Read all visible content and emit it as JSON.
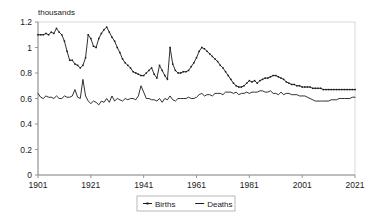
{
  "chart_data": {
    "type": "line",
    "title": "",
    "subtitle": "",
    "unit_label": "thousands",
    "xlabel": "",
    "ylabel": "",
    "xlim": [
      1901,
      2021
    ],
    "ylim": [
      0,
      1.2
    ],
    "ytick_values": [
      0,
      0.2,
      0.4,
      0.6,
      0.8,
      1,
      1.2
    ],
    "ytick_labels": [
      "0",
      "0.2",
      "0.4",
      "0.6",
      "0.8",
      "1",
      "1.2"
    ],
    "xtick_values": [
      1901,
      1921,
      1941,
      1961,
      1981,
      2001,
      2021
    ],
    "xtick_labels": [
      "1901",
      "1921",
      "1941",
      "1961",
      "1981",
      "2001",
      "2021"
    ],
    "grid": false,
    "legend_position": "bottom-center",
    "x": [
      1901,
      1902,
      1903,
      1904,
      1905,
      1906,
      1907,
      1908,
      1909,
      1910,
      1911,
      1912,
      1913,
      1914,
      1915,
      1916,
      1917,
      1918,
      1919,
      1920,
      1921,
      1922,
      1923,
      1924,
      1925,
      1926,
      1927,
      1928,
      1929,
      1930,
      1931,
      1932,
      1933,
      1934,
      1935,
      1936,
      1937,
      1938,
      1939,
      1940,
      1941,
      1942,
      1943,
      1944,
      1945,
      1946,
      1947,
      1948,
      1949,
      1950,
      1951,
      1952,
      1953,
      1954,
      1955,
      1956,
      1957,
      1958,
      1959,
      1960,
      1961,
      1962,
      1963,
      1964,
      1965,
      1966,
      1967,
      1968,
      1969,
      1970,
      1971,
      1972,
      1973,
      1974,
      1975,
      1976,
      1977,
      1978,
      1979,
      1980,
      1981,
      1982,
      1983,
      1984,
      1985,
      1986,
      1987,
      1988,
      1989,
      1990,
      1991,
      1992,
      1993,
      1994,
      1995,
      1996,
      1997,
      1998,
      1999,
      2000,
      2001,
      2002,
      2003,
      2004,
      2005,
      2006,
      2007,
      2008,
      2009,
      2010,
      2011,
      2012,
      2013,
      2014,
      2015,
      2016,
      2017,
      2018,
      2019,
      2020,
      2021
    ],
    "series": [
      {
        "name": "Births",
        "marker": "small-dot",
        "color": "#1a1a1a",
        "values": [
          1.1,
          1.1,
          1.1,
          1.11,
          1.1,
          1.12,
          1.11,
          1.15,
          1.12,
          1.1,
          1.05,
          0.97,
          0.9,
          0.9,
          0.87,
          0.86,
          0.84,
          0.86,
          0.92,
          1.1,
          1.07,
          1.01,
          1.0,
          1.07,
          1.11,
          1.14,
          1.16,
          1.12,
          1.08,
          1.05,
          1.0,
          0.96,
          0.91,
          0.88,
          0.86,
          0.84,
          0.81,
          0.8,
          0.79,
          0.78,
          0.78,
          0.8,
          0.82,
          0.84,
          0.79,
          0.76,
          0.86,
          0.82,
          0.78,
          0.75,
          1.0,
          0.87,
          0.82,
          0.8,
          0.8,
          0.81,
          0.81,
          0.82,
          0.85,
          0.88,
          0.92,
          0.97,
          1.0,
          0.99,
          0.97,
          0.95,
          0.93,
          0.91,
          0.89,
          0.86,
          0.84,
          0.81,
          0.78,
          0.75,
          0.72,
          0.7,
          0.69,
          0.69,
          0.7,
          0.72,
          0.74,
          0.73,
          0.74,
          0.72,
          0.74,
          0.75,
          0.76,
          0.76,
          0.77,
          0.78,
          0.78,
          0.77,
          0.76,
          0.75,
          0.73,
          0.72,
          0.71,
          0.71,
          0.7,
          0.7,
          0.69,
          0.69,
          0.69,
          0.69,
          0.68,
          0.68,
          0.68,
          0.68,
          0.67,
          0.67,
          0.67,
          0.67,
          0.67,
          0.67,
          0.67,
          0.67,
          0.67,
          0.67,
          0.67,
          0.67,
          0.67
        ]
      },
      {
        "name": "Deaths",
        "marker": "none",
        "color": "#1a1a1a",
        "values": [
          0.64,
          0.61,
          0.6,
          0.62,
          0.61,
          0.61,
          0.6,
          0.62,
          0.6,
          0.6,
          0.62,
          0.61,
          0.61,
          0.62,
          0.67,
          0.61,
          0.6,
          0.75,
          0.62,
          0.58,
          0.56,
          0.58,
          0.57,
          0.55,
          0.58,
          0.57,
          0.6,
          0.57,
          0.62,
          0.58,
          0.6,
          0.59,
          0.58,
          0.6,
          0.59,
          0.6,
          0.6,
          0.59,
          0.62,
          0.7,
          0.65,
          0.6,
          0.6,
          0.59,
          0.59,
          0.58,
          0.6,
          0.57,
          0.6,
          0.59,
          0.62,
          0.59,
          0.58,
          0.6,
          0.6,
          0.6,
          0.6,
          0.61,
          0.6,
          0.6,
          0.61,
          0.63,
          0.64,
          0.62,
          0.63,
          0.63,
          0.62,
          0.64,
          0.64,
          0.64,
          0.63,
          0.65,
          0.65,
          0.65,
          0.64,
          0.65,
          0.63,
          0.64,
          0.64,
          0.65,
          0.64,
          0.65,
          0.65,
          0.65,
          0.66,
          0.66,
          0.65,
          0.65,
          0.66,
          0.64,
          0.64,
          0.63,
          0.65,
          0.63,
          0.64,
          0.64,
          0.63,
          0.63,
          0.63,
          0.62,
          0.62,
          0.62,
          0.61,
          0.6,
          0.59,
          0.58,
          0.58,
          0.58,
          0.58,
          0.58,
          0.58,
          0.59,
          0.59,
          0.59,
          0.6,
          0.6,
          0.6,
          0.6,
          0.6,
          0.61,
          0.61
        ]
      }
    ]
  },
  "legend": {
    "items": [
      {
        "label": "Births"
      },
      {
        "label": "Deaths"
      }
    ]
  }
}
